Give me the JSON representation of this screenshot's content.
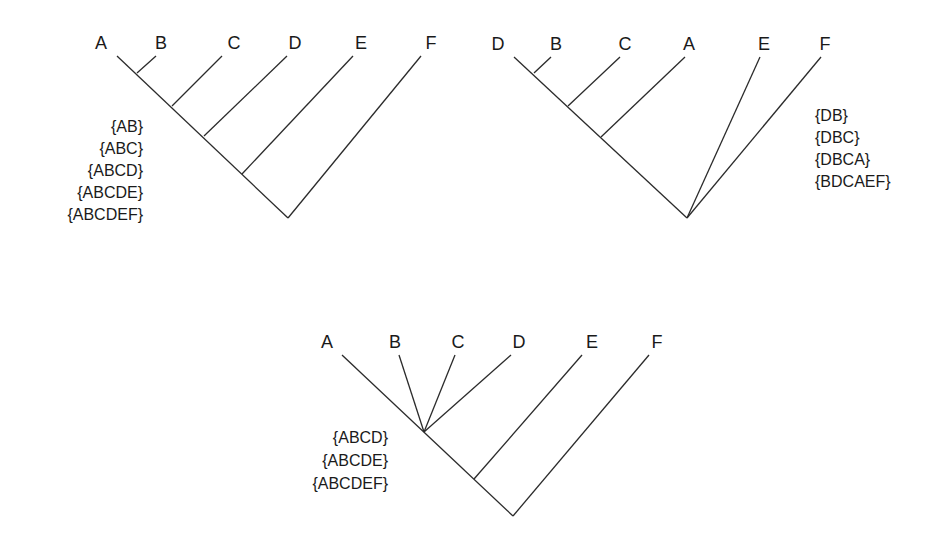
{
  "trees": [
    {
      "id": "tree-1",
      "taxa": [
        "A",
        "B",
        "C",
        "D",
        "E",
        "F"
      ],
      "clades": [
        "{AB}",
        "{ABC}",
        "{ABCD}",
        "{ABCDE}",
        "{ABCDEF}"
      ],
      "clade_label_align": "right"
    },
    {
      "id": "tree-2",
      "taxa": [
        "D",
        "B",
        "C",
        "A",
        "E",
        "F"
      ],
      "clades": [
        "{DB}",
        "{DBC}",
        "{DBCA}",
        "{BDCAEF}"
      ],
      "clade_label_align": "left"
    },
    {
      "id": "tree-3",
      "taxa": [
        "A",
        "B",
        "C",
        "D",
        "E",
        "F"
      ],
      "clades": [
        "{ABCD}",
        "{ABCDE}",
        "{ABCDEF}"
      ],
      "clade_label_align": "right"
    }
  ],
  "colors": {
    "line": "#2b2b2b",
    "text": "#1a1a1a",
    "background": "#ffffff"
  }
}
